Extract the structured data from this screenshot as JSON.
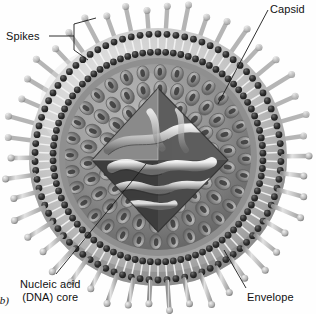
{
  "figure": {
    "panel_letter": "(b)",
    "background_color": "#ffffff",
    "text_color": "#111111",
    "style": "grayscale airbrush scientific illustration, cutaway view"
  },
  "labels": {
    "spikes": "Spikes",
    "capsid": "Capsid",
    "envelope": "Envelope",
    "nucleic_acid_line1": "Nucleic acid",
    "nucleic_acid_line2": "(DNA) core"
  },
  "structures": [
    {
      "name": "spikes",
      "label": "Spikes",
      "description": "glycoprotein projections with rounded knob heads radiating from envelope",
      "count": 46,
      "color": "#b9b9b9"
    },
    {
      "name": "envelope",
      "label": "Envelope",
      "description": "phospholipid bilayer with dark head groups and light fatty acid tails",
      "color": "#c9c9c9",
      "head_color": "#2b2b2b"
    },
    {
      "name": "capsid",
      "label": "Capsid",
      "description": "icosahedral protein coat built from hexagonal capsomeres with central pores",
      "color": "#8d8d8d"
    },
    {
      "name": "nucleic_acid_core",
      "label": "Nucleic acid (DNA) core",
      "description": "coiled double-stranded DNA within the cutaway cavity",
      "color": "#e8e8e8"
    }
  ],
  "colors": {
    "envelope_outer": "#cfcfcf",
    "envelope_shadow": "#9a9a9a",
    "bilayer_head": "#2f2f2f",
    "bilayer_tail": "#f2f2f2",
    "capsid_light": "#a8a8a8",
    "capsid_dark": "#5c5c5c",
    "capsomere_pore": "#3a3a3a",
    "core_cavity": "#4a4a4a",
    "dna_highlight": "#f5f5f5",
    "spike_light": "#d4d4d4",
    "spike_dark": "#7d7d7d",
    "leader_line": "#1a1a1a"
  },
  "leader_lines": {
    "spikes": "bracket from text to two spikes at upper left",
    "capsid": "diagonal from upper right text down to capsid surface",
    "envelope": "diagonal from lower right text up to envelope surface",
    "nucleic_acid": "diagonal from lower left text up to DNA core"
  }
}
